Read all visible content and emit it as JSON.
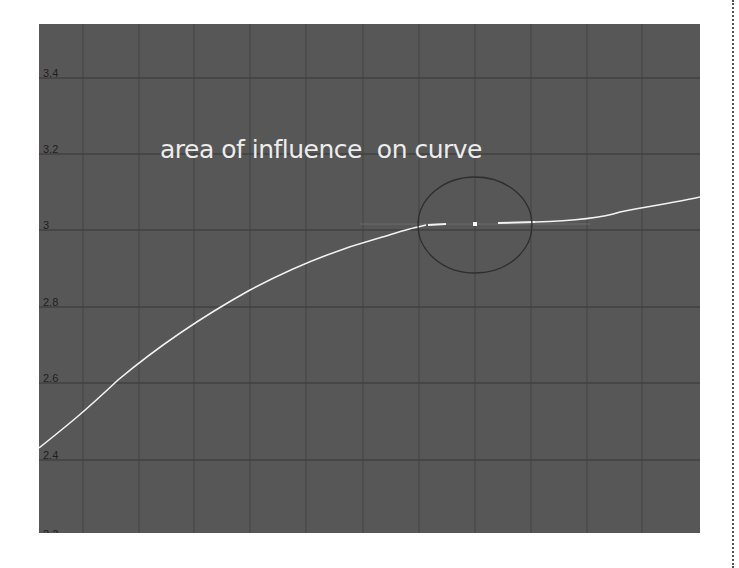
{
  "graph_editor": {
    "annotation": "area of influence  on curve",
    "y_axis_labels": [
      {
        "value": "3.4",
        "y": 55
      },
      {
        "value": "3.2",
        "y": 131
      },
      {
        "value": "3",
        "y": 207
      },
      {
        "value": "2.8",
        "y": 284
      },
      {
        "value": "2.6",
        "y": 360
      },
      {
        "value": "2.4",
        "y": 437
      },
      {
        "value": "2.2",
        "y": 513
      }
    ],
    "colors": {
      "background": "#575757",
      "grid_minor": "#4a4a4a",
      "grid_major": "#3f3f3f",
      "curve": "#f2f2f2",
      "influence_circle": "#2e2e2e",
      "key": "#ffffff",
      "annotation_text": "#ececec"
    },
    "selected_key": {
      "value": "3",
      "icon": "key-point-icon"
    },
    "influence_area_icon": "influence-circle-icon"
  }
}
